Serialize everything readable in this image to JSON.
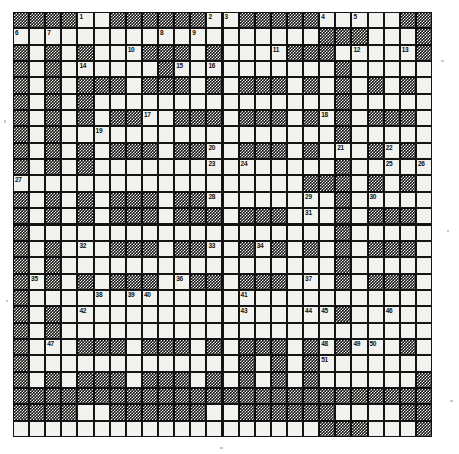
{
  "puzzle": {
    "title": "crossword-grid",
    "type": "crossword",
    "columns": 26,
    "rows": 26,
    "cell_size": 16.1,
    "colors": {
      "block_fill": "#121212",
      "block_pattern": "#f2f2ee",
      "cell_fill": "#f2f2ee",
      "grid_line": "#151515",
      "number_text": "#101010",
      "page_background": "#ffffff"
    },
    "max_clue_number": 51,
    "legend": {
      "white_cell": "answer-cell",
      "black_cell": "blocked-cell"
    },
    "rows_data": [
      "BBBBWWBBBBBBWWBBBBBBWWWWBBB",
      "WWWWWWWWWWWWWWWWWWWBBBWWWBB",
      "BWBWBWWBBBBWBWWWBBBBWBWWWBB",
      "BWBWWWWWWBWWWWWWWWWWBWWWWWB",
      "BWBWBBBWBBBWBWBBBWBWBWBWBWB",
      "BWBWBWWWWWWWWWWWWWWWBWWWWWB",
      "BWBWBWBBBWBBBWBBBWBWBWBBBWB",
      "BWBWWWWWWWWWWWWWWWWWBWWWWWB",
      "BWBWBWBBBWBBBWBBBWBWBWBBBWB",
      "BWBWBWWWWWWWWWWWWWWWBWWWWWW",
      "WWWWWWWWWWWWWWWWWWBBBWBWBWB",
      "BWBWBWBBBWBBBWWWWWWWBWWWWWB",
      "BWBWBWBBBWBBBWBBBWBWBWBBBWB",
      "BWWWWWWWWWWWWWWWWWWWBWWWWWB",
      "BWBWBWBBBWBBBWBBBWBWBWBBBWB",
      "BWBWWWWWWWWWWWWWWWWWBWWWWWB",
      "BWBWBWBBBWBBBWBBBWBWBWBBBWB",
      "BWWWWWWWWWWWWWWWWWWWWWWWWWB",
      "BWBWBWWWWWWWWWWWWWWWBWWWWWB",
      "BWBWWWWWWWWWWWWWWWWWWWWWWWB",
      "BWBWBBBWBBBWBWBBBWBWBWBWBWB",
      "BWWWWWWWWWWWWWBWBWBWWWWWWWB",
      "BWBWBBBWBBBWBWBWBWBWWWWWWBB",
      "BBBBBBBBBBBBBBBBBBBBBBBBBBB"
    ],
    "clue_numbers": [
      {
        "n": 1,
        "col": 5,
        "row": 1
      },
      {
        "n": 2,
        "col": 13,
        "row": 1
      },
      {
        "n": 3,
        "col": 14,
        "row": 1
      },
      {
        "n": 4,
        "col": 20,
        "row": 1
      },
      {
        "n": 5,
        "col": 22,
        "row": 1
      },
      {
        "n": 6,
        "col": 1,
        "row": 2
      },
      {
        "n": 7,
        "col": 3,
        "row": 2
      },
      {
        "n": 8,
        "col": 10,
        "row": 2
      },
      {
        "n": 9,
        "col": 12,
        "row": 2
      },
      {
        "n": 10,
        "col": 8,
        "row": 3
      },
      {
        "n": 11,
        "col": 17,
        "row": 3
      },
      {
        "n": 12,
        "col": 22,
        "row": 3
      },
      {
        "n": 13,
        "col": 25,
        "row": 3
      },
      {
        "n": 14,
        "col": 5,
        "row": 4
      },
      {
        "n": 15,
        "col": 11,
        "row": 4
      },
      {
        "n": 16,
        "col": 13,
        "row": 4
      },
      {
        "n": 17,
        "col": 9,
        "row": 7
      },
      {
        "n": 18,
        "col": 20,
        "row": 7
      },
      {
        "n": 19,
        "col": 6,
        "row": 8
      },
      {
        "n": 20,
        "col": 13,
        "row": 9
      },
      {
        "n": 21,
        "col": 21,
        "row": 9
      },
      {
        "n": 22,
        "col": 24,
        "row": 9
      },
      {
        "n": 23,
        "col": 13,
        "row": 10
      },
      {
        "n": 24,
        "col": 15,
        "row": 10
      },
      {
        "n": 25,
        "col": 24,
        "row": 10
      },
      {
        "n": 26,
        "col": 26,
        "row": 10
      },
      {
        "n": 27,
        "col": 1,
        "row": 11
      },
      {
        "n": 28,
        "col": 13,
        "row": 12
      },
      {
        "n": 29,
        "col": 19,
        "row": 12
      },
      {
        "n": 30,
        "col": 23,
        "row": 12
      },
      {
        "n": 31,
        "col": 19,
        "row": 13
      },
      {
        "n": 32,
        "col": 5,
        "row": 15
      },
      {
        "n": 33,
        "col": 13,
        "row": 15
      },
      {
        "n": 34,
        "col": 16,
        "row": 15
      },
      {
        "n": 35,
        "col": 2,
        "row": 17
      },
      {
        "n": 36,
        "col": 11,
        "row": 17
      },
      {
        "n": 37,
        "col": 19,
        "row": 17
      },
      {
        "n": 38,
        "col": 6,
        "row": 18
      },
      {
        "n": 39,
        "col": 8,
        "row": 18
      },
      {
        "n": 40,
        "col": 9,
        "row": 18
      },
      {
        "n": 41,
        "col": 15,
        "row": 18
      },
      {
        "n": 42,
        "col": 5,
        "row": 19
      },
      {
        "n": 43,
        "col": 15,
        "row": 19
      },
      {
        "n": 44,
        "col": 19,
        "row": 19
      },
      {
        "n": 45,
        "col": 20,
        "row": 19
      },
      {
        "n": 46,
        "col": 24,
        "row": 19
      },
      {
        "n": 47,
        "col": 3,
        "row": 21
      },
      {
        "n": 48,
        "col": 20,
        "row": 21
      },
      {
        "n": 49,
        "col": 22,
        "row": 21
      },
      {
        "n": 50,
        "col": 23,
        "row": 21
      },
      {
        "n": 51,
        "col": 20,
        "row": 22
      }
    ]
  }
}
